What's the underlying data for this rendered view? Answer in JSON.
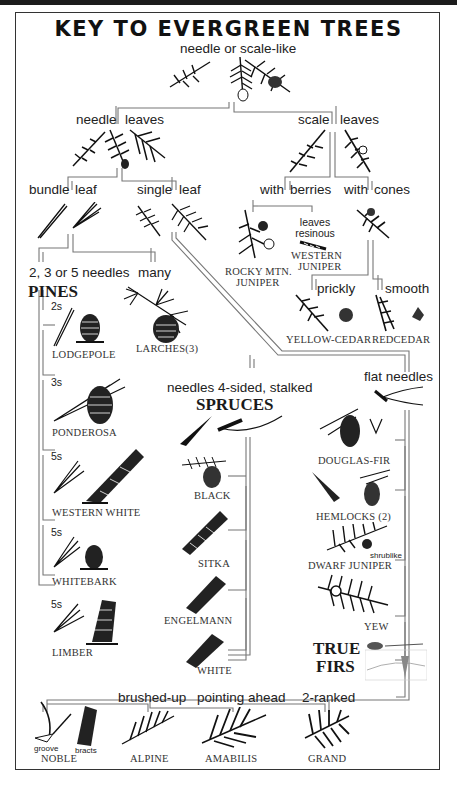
{
  "title": "KEY TO EVERGREEN TREES",
  "root": {
    "label": "needle or scale-like"
  },
  "branches": {
    "needle": {
      "left": "needle",
      "right": "leaves"
    },
    "scale": {
      "left": "scale",
      "right": "leaves"
    },
    "bundle": {
      "left": "bundle",
      "right": "leaf"
    },
    "single": {
      "left": "single",
      "right": "leaf"
    },
    "berries": {
      "left": "with",
      "right": "berries"
    },
    "cones": {
      "left": "with",
      "right": "cones"
    },
    "resinous": {
      "line1": "leaves",
      "line2": "resinous"
    },
    "pines_count": "2, 3 or 5 needles",
    "many": "many",
    "prickly": "prickly",
    "smooth": "smooth",
    "spruce_desc": "needles 4-sided, stalked",
    "flat": "flat needles",
    "brushed": "brushed-up",
    "pointing": "pointing ahead",
    "ranked": "2-ranked"
  },
  "groups": {
    "pines": "PINES",
    "spruces": "SPRUCES",
    "true_firs_1": "TRUE",
    "true_firs_2": "FIRS"
  },
  "pines": [
    {
      "count": "2s",
      "name": "LODGEPOLE"
    },
    {
      "count": "3s",
      "name": "PONDEROSA"
    },
    {
      "count": "5s",
      "name": "WESTERN WHITE"
    },
    {
      "count": "5s",
      "name": "WHITEBARK"
    },
    {
      "count": "5s",
      "name": "LIMBER"
    }
  ],
  "larches": "LARCHES(3)",
  "junipers": {
    "rocky_1": "ROCKY MTN.",
    "rocky_2": "JUNIPER",
    "western_1": "WESTERN",
    "western_2": "JUNIPER"
  },
  "cedars": {
    "yellow": "YELLOW-CEDAR",
    "red": "REDCEDAR"
  },
  "spruces": [
    "BLACK",
    "SITKA",
    "ENGELMANN",
    "WHITE"
  ],
  "flat_needle_trees": {
    "douglas": "DOUGLAS-FIR",
    "hemlocks": "HEMLOCKS (2)",
    "shrublike": "shrublike",
    "dwarf": "DWARF JUNIPER",
    "yew": "YEW"
  },
  "firs": {
    "noble": "NOBLE",
    "groove": "groove",
    "bracts": "bracts",
    "alpine": "ALPINE",
    "amabilis": "AMABILIS",
    "grand": "GRAND"
  }
}
